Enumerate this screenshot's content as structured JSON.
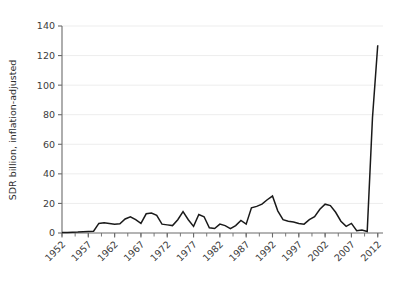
{
  "chart_data": {
    "type": "line",
    "title": "",
    "subtitle": "",
    "xlabel": "",
    "ylabel": "SDR billion, inflation-adjusted",
    "xlim": [
      1952,
      2013
    ],
    "ylim": [
      0,
      140
    ],
    "grid": true,
    "grid_axis": "y",
    "legend": null,
    "legend_position": "none",
    "line_color": "#1a1a1a",
    "axis_color": "#6b6b6b",
    "grid_color": "#ededed",
    "background_color": "#ffffff",
    "yticks": [
      0,
      20,
      40,
      60,
      80,
      100,
      120,
      140
    ],
    "ytick_labels": [
      "0",
      "20",
      "40",
      "60",
      "80",
      "100",
      "120",
      "140"
    ],
    "xticks": [
      1952,
      1957,
      1962,
      1967,
      1972,
      1977,
      1982,
      1987,
      1992,
      1997,
      2002,
      2007,
      2012
    ],
    "xtick_labels": [
      "1952",
      "1957",
      "1962",
      "1967",
      "1972",
      "1977",
      "1982",
      "1987",
      "1992",
      "1997",
      "2002",
      "2007",
      "2012"
    ],
    "xtick_rotation": -45,
    "minor_xtick_interval": 2.5,
    "x": [
      1952,
      1953,
      1954,
      1955,
      1956,
      1957,
      1958,
      1959,
      1960,
      1961,
      1962,
      1963,
      1964,
      1965,
      1966,
      1967,
      1968,
      1969,
      1970,
      1971,
      1972,
      1973,
      1974,
      1975,
      1976,
      1977,
      1978,
      1979,
      1980,
      1981,
      1982,
      1983,
      1984,
      1985,
      1986,
      1987,
      1988,
      1989,
      1990,
      1991,
      1992,
      1993,
      1994,
      1995,
      1996,
      1997,
      1998,
      1999,
      2000,
      2001,
      2002,
      2003,
      2004,
      2005,
      2006,
      2007,
      2008,
      2009,
      2010,
      2011,
      2012
    ],
    "series": [
      {
        "name": "IMF lending arrangements",
        "values": [
          0.3,
          0.4,
          0.5,
          0.6,
          0.8,
          1.0,
          1.2,
          6.5,
          7.0,
          6.5,
          6.0,
          6.2,
          9.5,
          11.0,
          9.0,
          6.5,
          13.0,
          13.5,
          12.0,
          6.0,
          5.5,
          5.0,
          9.0,
          14.5,
          9.0,
          4.5,
          12.5,
          11.0,
          3.5,
          3.0,
          6.0,
          5.0,
          3.0,
          5.0,
          8.5,
          6.0,
          17.0,
          18.0,
          19.5,
          22.5,
          25.0,
          15.0,
          9.0,
          8.0,
          7.5,
          6.5,
          6.0,
          9.0,
          11.0,
          16.0,
          19.5,
          18.5,
          14.0,
          8.0,
          4.5,
          6.5,
          1.5,
          2.0,
          1.0,
          78.0,
          127.0
        ]
      }
    ]
  },
  "axis": {
    "y_label": "SDR billion, inflation-adjusted"
  }
}
